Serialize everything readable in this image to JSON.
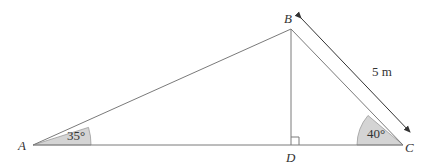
{
  "diagram": {
    "type": "triangle",
    "vertices": {
      "A": {
        "label": "A",
        "x": 33,
        "y": 145
      },
      "B": {
        "label": "B",
        "x": 291,
        "y": 29
      },
      "C": {
        "label": "C",
        "x": 403,
        "y": 145
      },
      "D": {
        "label": "D",
        "x": 291,
        "y": 145
      }
    },
    "angles": {
      "A": {
        "value": "35°"
      },
      "C": {
        "value": "40°"
      }
    },
    "length_BC": {
      "label": "5 m"
    },
    "right_angle_at": "D",
    "colors": {
      "line": "#7a7a7a",
      "angle_fill": "#d4d4d4",
      "text": "#333333"
    }
  }
}
